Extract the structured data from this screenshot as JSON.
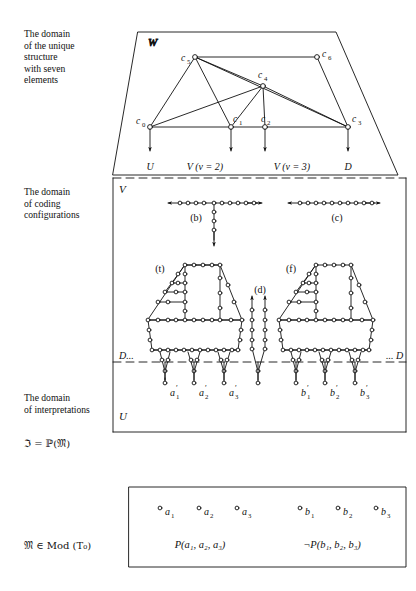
{
  "figure": {
    "colors": {
      "ink": "#111111",
      "paper": "#ffffff",
      "node_fill": "#ffffff"
    }
  },
  "left_labels": {
    "domain_unique_structure": "The domain\nof the unique\nstructure\nwith seven\nelements",
    "domain_unique_structure_lines": [
      "The domain",
      "of the unique",
      "structure",
      "with seven",
      "elements"
    ],
    "domain_coding": "The domain\nof coding\nconfigurations",
    "domain_coding_lines": [
      "The domain",
      "of coding",
      "configurations"
    ],
    "domain_interpretations": "The domain\nof interpretations",
    "domain_interpretations_lines": [
      "The domain",
      "of interpretations"
    ],
    "n_equals_p_m": "ℑ = ℙ(𝔐)",
    "m_in_mod_t0": "𝔐 ∈ Mod (T₀)"
  },
  "top_panel": {
    "region_label": "W",
    "nodes": [
      {
        "id": "c0",
        "label": "c₀",
        "x": 150,
        "y": 127,
        "filled": true
      },
      {
        "id": "c1",
        "label": "c₁",
        "x": 231,
        "y": 127,
        "filled": true
      },
      {
        "id": "c2",
        "label": "c₂",
        "x": 265,
        "y": 127,
        "filled": false
      },
      {
        "id": "c3",
        "label": "c₃",
        "x": 348,
        "y": 127,
        "filled": true
      },
      {
        "id": "c4",
        "label": "c₄",
        "x": 263,
        "y": 86,
        "filled": true
      },
      {
        "id": "c5",
        "label": "c₅",
        "x": 195,
        "y": 57,
        "filled": true
      },
      {
        "id": "c6",
        "label": "c₆",
        "x": 317,
        "y": 57,
        "filled": false
      }
    ],
    "edges": [
      [
        "c5",
        "c6"
      ],
      [
        "c5",
        "c0"
      ],
      [
        "c5",
        "c1"
      ],
      [
        "c5",
        "c4"
      ],
      [
        "c5",
        "c3"
      ],
      [
        "c6",
        "c3"
      ],
      [
        "c4",
        "c0"
      ],
      [
        "c4",
        "c1"
      ],
      [
        "c4",
        "c2"
      ],
      [
        "c4",
        "c3"
      ],
      [
        "c0",
        "c1"
      ],
      [
        "c1",
        "c2"
      ],
      [
        "c2",
        "c3"
      ]
    ],
    "arrow_labels": [
      {
        "text": "U",
        "x": 150
      },
      {
        "text": "V (v = 2)",
        "x": 203
      },
      {
        "text": "V (v = 3)",
        "x": 291
      },
      {
        "text": "D",
        "x": 348
      }
    ]
  },
  "middle_panel": {
    "region_label": "V",
    "config_b_label": "(b)",
    "config_c_label": "(c)",
    "config_t_label": "(t)",
    "config_f_label": "(f)",
    "config_d_label": "(d)",
    "boundary_left_label": "D...",
    "boundary_right_label": "... D"
  },
  "bottom_panel": {
    "region_label": "U",
    "interpretation_nodes": [
      {
        "label": "a₁′",
        "x": 162
      },
      {
        "label": "a₂′",
        "x": 202
      },
      {
        "label": "a₃′",
        "x": 242
      },
      {
        "label": "b₁′",
        "x": 303
      },
      {
        "label": "b₂′",
        "x": 343
      },
      {
        "label": "b₃′",
        "x": 381
      }
    ]
  },
  "model_panel": {
    "elements": [
      {
        "label": "a₁",
        "x": 160
      },
      {
        "label": "a₂",
        "x": 199
      },
      {
        "label": "a₃",
        "x": 237
      },
      {
        "label": "b₁",
        "x": 300
      },
      {
        "label": "b₂",
        "x": 338
      },
      {
        "label": "b₃",
        "x": 376
      }
    ],
    "formulas": [
      {
        "text": "P(a₁, a₂, a₃)",
        "x": 200
      },
      {
        "text": "¬P(b₁, b₂, b₃)",
        "x": 330
      }
    ]
  }
}
